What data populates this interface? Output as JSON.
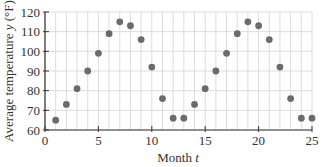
{
  "chart_data": {
    "type": "scatter",
    "title": "",
    "xlabel": "Month t",
    "ylabel": "Average temperature y (°F)",
    "xlim": [
      0,
      25
    ],
    "ylim": [
      60,
      120
    ],
    "xticks": [
      0,
      5,
      10,
      15,
      20,
      25
    ],
    "yticks": [
      60,
      70,
      80,
      90,
      100,
      110,
      120
    ],
    "grid": true,
    "legend": null,
    "series": [
      {
        "name": "Average temperature",
        "color": "#6b6b6b",
        "x": [
          1,
          2,
          3,
          4,
          5,
          6,
          7,
          8,
          9,
          10,
          11,
          12,
          13,
          14,
          15,
          16,
          17,
          18,
          19,
          20,
          21,
          22,
          23,
          24,
          25
        ],
        "values": [
          65,
          73,
          81,
          90,
          99,
          109,
          115,
          113,
          106,
          92,
          76,
          66,
          66,
          73,
          81,
          90,
          99,
          109,
          115,
          113,
          106,
          92,
          76,
          66,
          66
        ]
      }
    ]
  },
  "colors": {
    "grid": "#dcdcdc",
    "axis": "#333333",
    "point": "#6b6b6b"
  }
}
